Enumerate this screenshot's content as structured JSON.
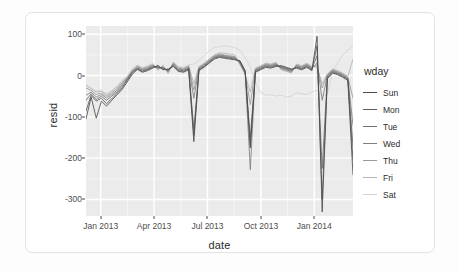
{
  "chart_data": {
    "type": "line",
    "title": "",
    "xlabel": "date",
    "ylabel": "resid",
    "grid": true,
    "legend_position": "right",
    "legend_title": "wday",
    "xlim": [
      "2013-01-01",
      "2014-01-01"
    ],
    "ylim": [
      -340,
      120
    ],
    "yticks": [
      100,
      0,
      -100,
      -200,
      -300
    ],
    "ytick_labels": [
      "100",
      "0",
      "-100",
      "-200",
      "-300"
    ],
    "xticks": [
      "Jan 2013",
      "Apr 2013",
      "Jul 2013",
      "Oct 2013",
      "Jan 2014"
    ],
    "series": [
      {
        "name": "Sun",
        "color": "#4b4b4b",
        "values": [
          -105,
          -52,
          -103,
          -62,
          -74,
          -60,
          -47,
          -34,
          -16,
          3,
          15,
          8,
          12,
          18,
          25,
          14,
          16,
          22,
          10,
          8,
          14,
          -160,
          12,
          20,
          30,
          40,
          44,
          42,
          40,
          38,
          36,
          12,
          -175,
          8,
          14,
          20,
          18,
          22,
          24,
          20,
          16,
          18,
          14,
          20,
          12,
          95,
          -330,
          -8,
          6,
          2,
          -4,
          -12,
          -240
        ]
      },
      {
        "name": "Mon",
        "color": "#5c5c5c",
        "values": [
          -86,
          -48,
          -62,
          -55,
          -68,
          -56,
          -44,
          -30,
          -12,
          6,
          16,
          10,
          14,
          20,
          22,
          16,
          14,
          24,
          12,
          10,
          16,
          -145,
          14,
          22,
          32,
          42,
          46,
          44,
          42,
          40,
          34,
          10,
          -168,
          10,
          16,
          22,
          20,
          24,
          22,
          18,
          14,
          20,
          16,
          22,
          14,
          72,
          -300,
          -5,
          8,
          4,
          -2,
          -10,
          -205
        ]
      },
      {
        "name": "Tue",
        "color": "#6e6e6e",
        "values": [
          -60,
          -44,
          -58,
          -50,
          -60,
          -50,
          -40,
          -26,
          -10,
          8,
          18,
          12,
          16,
          22,
          20,
          18,
          12,
          26,
          14,
          12,
          18,
          -130,
          16,
          24,
          34,
          44,
          48,
          46,
          44,
          42,
          32,
          8,
          -150,
          12,
          18,
          24,
          22,
          26,
          20,
          16,
          12,
          22,
          18,
          24,
          16,
          48,
          -225,
          -2,
          10,
          6,
          0,
          -8,
          -170
        ]
      },
      {
        "name": "Wed",
        "color": "#808080",
        "values": [
          -48,
          -40,
          -52,
          -46,
          -54,
          -46,
          -36,
          -22,
          -8,
          10,
          20,
          14,
          18,
          24,
          18,
          20,
          10,
          28,
          16,
          14,
          20,
          -55,
          18,
          26,
          36,
          46,
          50,
          48,
          46,
          44,
          30,
          6,
          -228,
          14,
          20,
          26,
          24,
          28,
          18,
          14,
          10,
          24,
          20,
          26,
          18,
          30,
          -60,
          0,
          12,
          8,
          2,
          -6,
          -120
        ]
      },
      {
        "name": "Thu",
        "color": "#9a9a9a",
        "values": [
          -30,
          -36,
          -46,
          -42,
          -50,
          -42,
          -32,
          -18,
          -6,
          12,
          22,
          16,
          20,
          26,
          16,
          22,
          8,
          30,
          18,
          16,
          22,
          -35,
          20,
          28,
          38,
          48,
          52,
          50,
          48,
          46,
          28,
          4,
          -70,
          16,
          22,
          28,
          26,
          30,
          16,
          12,
          8,
          26,
          22,
          28,
          20,
          24,
          -30,
          2,
          14,
          10,
          4,
          -4,
          -55
        ]
      },
      {
        "name": "Fri",
        "color": "#b5b5b5",
        "values": [
          -22,
          -32,
          -40,
          -38,
          -46,
          -38,
          -28,
          -14,
          -4,
          14,
          24,
          18,
          22,
          28,
          14,
          24,
          6,
          32,
          20,
          18,
          24,
          -20,
          22,
          30,
          40,
          50,
          55,
          54,
          52,
          50,
          26,
          2,
          -40,
          18,
          24,
          30,
          28,
          32,
          14,
          10,
          6,
          28,
          24,
          30,
          22,
          20,
          -20,
          4,
          16,
          12,
          6,
          -2,
          40
        ]
      },
      {
        "name": "Sat",
        "color": "#d2d2d2",
        "values": [
          -25,
          -30,
          -38,
          -35,
          -44,
          -36,
          -26,
          -12,
          -2,
          16,
          26,
          20,
          24,
          30,
          12,
          26,
          4,
          34,
          22,
          20,
          26,
          28,
          36,
          48,
          60,
          68,
          70,
          72,
          70,
          68,
          60,
          44,
          20,
          -18,
          -40,
          -48,
          -46,
          -50,
          -48,
          -52,
          -50,
          -42,
          -44,
          -46,
          -40,
          -35,
          -50,
          -45,
          10,
          30,
          50,
          62,
          70
        ]
      }
    ],
    "annotations": [
      {
        "label": "New Year dip",
        "approx_date": "2013-01-01",
        "approx_value": -105
      },
      {
        "label": "Memorial Day",
        "approx_date": "2013-05-27",
        "approx_value": -160
      },
      {
        "label": "July 4th",
        "approx_date": "2013-07-04",
        "approx_value": -228
      },
      {
        "label": "Labor Day",
        "approx_date": "2013-09-02",
        "approx_value": -175
      },
      {
        "label": "Thanksgiving peak",
        "approx_date": "2013-11-28",
        "approx_value": 95
      },
      {
        "label": "Thanksgiving drop",
        "approx_date": "2013-11-29",
        "approx_value": -330
      },
      {
        "label": "Christmas drop",
        "approx_date": "2013-12-25",
        "approx_value": -240
      }
    ]
  },
  "legend": {
    "title": "wday",
    "items": [
      {
        "label": "Sun",
        "color": "#4b4b4b"
      },
      {
        "label": "Mon",
        "color": "#5c5c5c"
      },
      {
        "label": "Tue",
        "color": "#6e6e6e"
      },
      {
        "label": "Wed",
        "color": "#808080"
      },
      {
        "label": "Thu",
        "color": "#9a9a9a"
      },
      {
        "label": "Fri",
        "color": "#b5b5b5"
      },
      {
        "label": "Sat",
        "color": "#d2d2d2"
      }
    ]
  },
  "theme": {
    "panel_background": "#ebebeb",
    "grid_color": "#ffffff",
    "text_color": "#2b2b2b",
    "tick_color": "#4d4d4d",
    "card_background": "#ffffff",
    "card_border": "#e3e3e3"
  }
}
